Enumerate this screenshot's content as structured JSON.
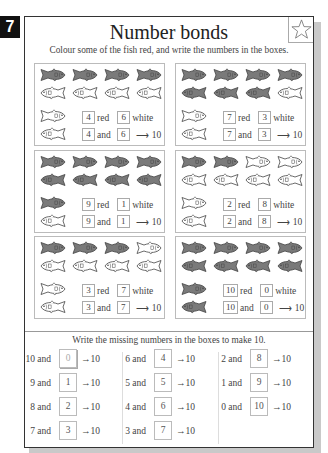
{
  "page_number": "7",
  "header": {
    "title": "Number bonds",
    "subtitle": "Colour some of the fish red, and write the numbers in the boxes.",
    "star_icon": "star-outline-icon"
  },
  "labels": {
    "red": "red",
    "white": "white",
    "and": "and",
    "arrow": "⟶",
    "total": "10"
  },
  "panels": [
    {
      "red_count": 4,
      "red": "4",
      "white": "6",
      "and_a": "4",
      "and_b": "6",
      "total": "10"
    },
    {
      "red_count": 7,
      "red": "7",
      "white": "3",
      "and_a": "7",
      "and_b": "3",
      "total": "10"
    },
    {
      "red_count": 9,
      "red": "9",
      "white": "1",
      "and_a": "9",
      "and_b": "1",
      "total": "10"
    },
    {
      "red_count": 2,
      "red": "2",
      "white": "8",
      "and_a": "2",
      "and_b": "8",
      "total": "10"
    },
    {
      "red_count": 3,
      "red": "3",
      "white": "7",
      "and_a": "3",
      "and_b": "7",
      "total": "10"
    },
    {
      "red_count": 10,
      "red": "10",
      "white": "0",
      "and_a": "10",
      "and_b": "0",
      "total": "10"
    }
  ],
  "colors": {
    "filled_fish": "#7a7a7a",
    "fish_outline": "#444444",
    "white_fish": "#ffffff"
  },
  "bonds_section": {
    "instruction": "Write the missing numbers in the boxes to make 10.",
    "arrow": "→10",
    "columns": [
      [
        {
          "label": "10 and",
          "answer": "0"
        },
        {
          "label": "9 and",
          "answer": "1"
        },
        {
          "label": "8 and",
          "answer": "2"
        },
        {
          "label": "7 and",
          "answer": "3"
        }
      ],
      [
        {
          "label": "6 and",
          "answer": "4"
        },
        {
          "label": "5 and",
          "answer": "5"
        },
        {
          "label": "4 and",
          "answer": "6"
        },
        {
          "label": "3 and",
          "answer": "7"
        }
      ],
      [
        {
          "label": "2 and",
          "answer": "8"
        },
        {
          "label": "1 and",
          "answer": "9"
        },
        {
          "label": "0 and",
          "answer": "10"
        }
      ]
    ]
  }
}
